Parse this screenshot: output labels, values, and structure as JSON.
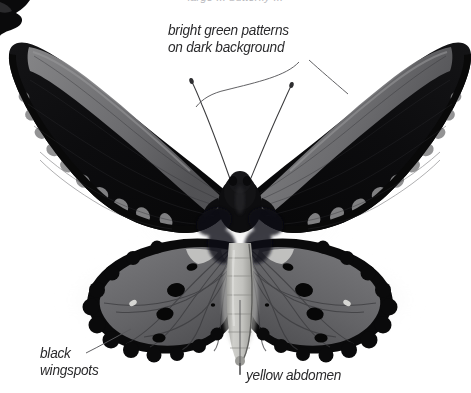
{
  "figure": {
    "background_color": "#ffffff",
    "width": 471,
    "height": 393
  },
  "caption": {
    "top_cut_off_line": "large ... butterfly ...",
    "color": "#b9b9bd"
  },
  "annotations": [
    {
      "id": "green-patterns",
      "line1": "bright green patterns",
      "line2": "on dark background",
      "color": "#2a2a2c"
    },
    {
      "id": "black-wingspots",
      "line1": "black",
      "line2": "wingspots",
      "color": "#2a2a2c"
    },
    {
      "id": "yellow-abdomen",
      "line1": "yellow abdomen",
      "line2": "",
      "color": "#2a2a2c"
    }
  ],
  "leader_lines": [
    {
      "id": "leader-green-to-left-forewing",
      "from": [
        300,
        60
      ],
      "to": [
        188,
        105
      ]
    },
    {
      "id": "leader-green-to-right-forewing",
      "from": [
        308,
        58
      ],
      "to": [
        352,
        95
      ]
    },
    {
      "id": "leader-black-wingspots",
      "from": [
        88,
        352
      ],
      "to": [
        130,
        330
      ]
    },
    {
      "id": "leader-yellow-abdomen",
      "from": [
        240,
        372
      ],
      "to": [
        240,
        300
      ]
    }
  ],
  "palette": {
    "wing_black": "#0b0b0c",
    "wing_dark": "#1a1a1c",
    "wing_gray": "#6a6a6c",
    "wing_gray_light": "#8e8e90",
    "band_gray": "#7c7c7e",
    "spot_black": "#090909",
    "abdomen_light": "#c9c9c6",
    "abdomen_mid": "#a9a9a6",
    "body_black": "#101012",
    "shadow": "#d8d8d8",
    "text": "#2a2a2c",
    "caption_gray": "#b9b9bd"
  },
  "parts": [
    {
      "name": "left-forewing",
      "description": "black forewing with pale costal band and scalloped marginal spots"
    },
    {
      "name": "right-forewing",
      "description": "black forewing with pale costal band and scalloped marginal spots"
    },
    {
      "name": "left-hindwing",
      "description": "gray hindwing, black border, four black oval wingspots"
    },
    {
      "name": "right-hindwing",
      "description": "gray hindwing, black border, four black oval wingspots"
    },
    {
      "name": "thorax",
      "description": "dark furry thorax"
    },
    {
      "name": "abdomen",
      "description": "pale segmented abdomen"
    },
    {
      "name": "antennae",
      "description": "two thin clubbed antennae in V shape"
    },
    {
      "name": "corner-wing-fragment",
      "description": "black wing fragment cropped at top-left corner"
    }
  ]
}
